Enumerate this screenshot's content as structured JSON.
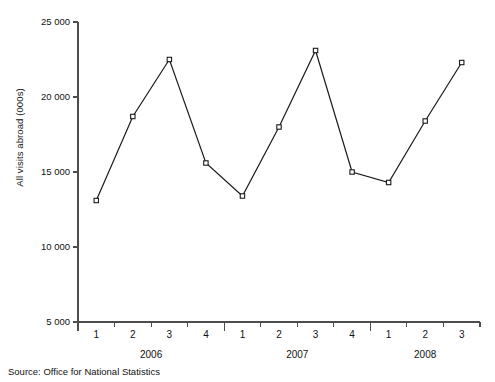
{
  "source": {
    "prefix": "Source:",
    "text": "Source:  Office for National Statistics"
  },
  "chart_data": {
    "type": "line",
    "title": "",
    "subtitle": "",
    "xlabel": "",
    "ylabel": "All visits abroad (000s)",
    "ylim": [
      5000,
      25000
    ],
    "ytick_step": 5000,
    "ytick_labels": [
      "25 000",
      "20 000",
      "15 000",
      "10 000",
      "5 000"
    ],
    "ytick_values": [
      25000,
      20000,
      15000,
      10000,
      5000
    ],
    "grid": false,
    "legend": false,
    "legend_position": "none",
    "marker": "open-square",
    "line_color": "#1a1a1a",
    "axis_color": "#4d4d4d",
    "categories": [
      "2006 Q1",
      "2006 Q2",
      "2006 Q3",
      "2006 Q4",
      "2007 Q1",
      "2007 Q2",
      "2007 Q3",
      "2007 Q4",
      "2008 Q1",
      "2008 Q2",
      "2008 Q3"
    ],
    "quarter_labels": [
      "1",
      "2",
      "3",
      "4",
      "1",
      "2",
      "3",
      "4",
      "1",
      "2",
      "3"
    ],
    "year_groups": [
      {
        "label": "2006",
        "quarters": [
          "1",
          "2",
          "3",
          "4"
        ]
      },
      {
        "label": "2007",
        "quarters": [
          "1",
          "2",
          "3",
          "4"
        ]
      },
      {
        "label": "2008",
        "quarters": [
          "1",
          "2",
          "3"
        ]
      }
    ],
    "values": [
      13100,
      18700,
      22500,
      15600,
      13400,
      18000,
      23100,
      15000,
      14300,
      18400,
      22300
    ],
    "series": [
      {
        "name": "All visits abroad (000s)",
        "values": [
          13100,
          18700,
          22500,
          15600,
          13400,
          18000,
          23100,
          15000,
          14300,
          18400,
          22300
        ]
      }
    ]
  }
}
